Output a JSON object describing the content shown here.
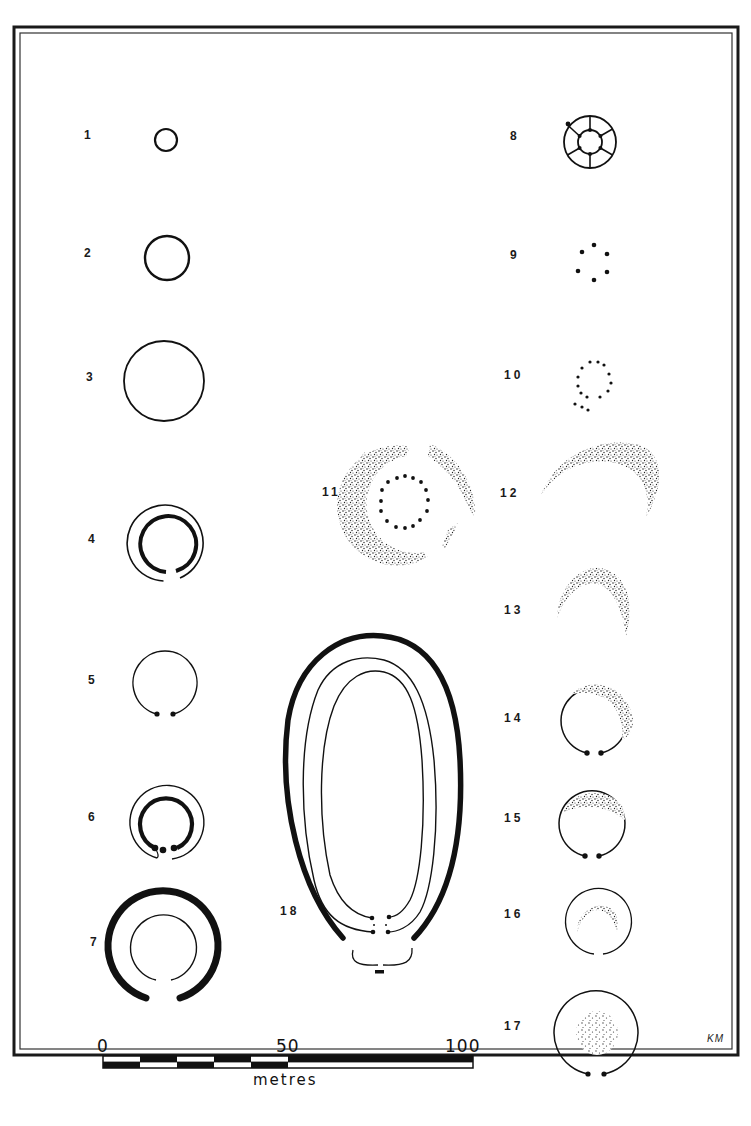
{
  "plate": {
    "colors": {
      "ink": "#111111",
      "paper": "#ffffff",
      "stipple": "#222222"
    },
    "initials": "KM"
  },
  "figures": [
    {
      "id": 1,
      "label": "1",
      "type": "plain-ring-small"
    },
    {
      "id": 2,
      "label": "2",
      "type": "plain-ring-medium"
    },
    {
      "id": 3,
      "label": "3",
      "type": "plain-ring-large"
    },
    {
      "id": 4,
      "label": "4",
      "type": "double-ring-with-entrance"
    },
    {
      "id": 5,
      "label": "5",
      "type": "penannular-ring-with-terminals"
    },
    {
      "id": 6,
      "label": "6",
      "type": "double-penannular-with-terminals"
    },
    {
      "id": 7,
      "label": "7",
      "type": "heavy-outer-penannular-with-inner-ring"
    },
    {
      "id": 8,
      "label": "8",
      "type": "spoked-ring"
    },
    {
      "id": 9,
      "label": "9",
      "type": "post-ring-six"
    },
    {
      "id": 10,
      "label": "10",
      "type": "post-ring-many"
    },
    {
      "id": 11,
      "label": "11",
      "type": "stippled-bank-with-post-ring"
    },
    {
      "id": 12,
      "label": "12",
      "type": "stippled-crescent-large"
    },
    {
      "id": 13,
      "label": "13",
      "type": "stippled-crescent-small"
    },
    {
      "id": 14,
      "label": "14",
      "type": "penannular-with-stippled-bank"
    },
    {
      "id": 15,
      "label": "15",
      "type": "penannular-with-stippled-cap"
    },
    {
      "id": 16,
      "label": "16",
      "type": "ring-with-inner-stippled-arc"
    },
    {
      "id": 17,
      "label": "17",
      "type": "penannular-with-central-mound"
    },
    {
      "id": 18,
      "label": "18",
      "type": "large-oval-enclosure"
    }
  ],
  "scale_bar": {
    "ticks": [
      "0",
      "50",
      "100"
    ],
    "unit": "metres",
    "min": 0,
    "max": 100
  }
}
